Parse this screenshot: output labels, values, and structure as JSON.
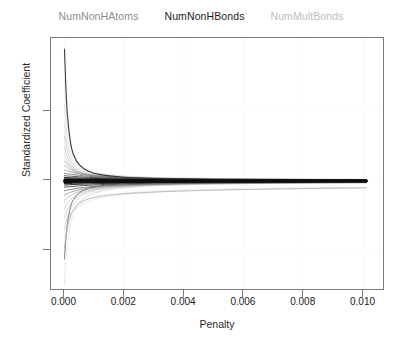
{
  "legend": {
    "position": "top-center",
    "items": [
      {
        "label": "NumNonHAtoms",
        "color": "#8c8c8c"
      },
      {
        "label": "NumNonHBonds",
        "color": "#1a1a1a"
      },
      {
        "label": "NumMultBonds",
        "color": "#bdbdbd"
      }
    ]
  },
  "axes": {
    "xlabel": "Penalty",
    "ylabel": "Standardized Coefficient",
    "xticks": [
      "0.000",
      "0.002",
      "0.004",
      "0.006",
      "0.008",
      "0.010"
    ],
    "yticks": [
      "10",
      "0",
      "-10"
    ]
  },
  "chart_data": {
    "type": "line",
    "title": "",
    "subtitle": "",
    "xlabel": "Penalty",
    "ylabel": "Standardized Coefficient",
    "xlim": [
      -0.00045,
      0.01065
    ],
    "ylim": [
      -15.5,
      20.5
    ],
    "xticks": [
      0.0,
      0.002,
      0.004,
      0.006,
      0.008,
      0.01
    ],
    "xtick_labels": [
      "0.000",
      "0.002",
      "0.004",
      "0.006",
      "0.008",
      "0.010"
    ],
    "yticks": [
      10,
      0,
      -10
    ],
    "ytick_labels": [
      "10",
      "0",
      "-10"
    ],
    "grid": true,
    "grid_color": "#fafafa",
    "legend_position": "top-center",
    "x": [
      0.0,
      5e-05,
      0.0001,
      0.0002,
      0.0003,
      0.0005,
      0.0008,
      0.0012,
      0.0018,
      0.0025,
      0.0035,
      0.005,
      0.0065,
      0.008,
      0.0095,
      0.0101
    ],
    "series": [
      {
        "name": "NumNonHBonds",
        "color": "#303030",
        "width": 1.1,
        "opacity": 0.95,
        "values": [
          18.9,
          13.2,
          9.4,
          5.6,
          3.8,
          2.3,
          1.4,
          0.9,
          0.6,
          0.42,
          0.3,
          0.2,
          0.15,
          0.1,
          0.08,
          0.07
        ]
      },
      {
        "name": "NumNonHAtoms",
        "color": "#6f6f6f",
        "width": 1.0,
        "opacity": 0.85,
        "values": [
          -11.2,
          -8.1,
          -6.0,
          -3.8,
          -2.7,
          -1.7,
          -1.05,
          -0.7,
          -0.46,
          -0.33,
          -0.24,
          -0.16,
          -0.12,
          -0.09,
          -0.07,
          -0.06
        ]
      },
      {
        "name": "NumMultBonds",
        "color": "#b0b0b0",
        "width": 1.0,
        "opacity": 0.8,
        "values": [
          -9.6,
          -7.9,
          -6.6,
          -5.0,
          -4.1,
          -3.2,
          -2.6,
          -2.2,
          -1.9,
          -1.7,
          -1.5,
          -1.32,
          -1.2,
          -1.1,
          -1.02,
          -1.0
        ]
      },
      {
        "name": "path-04",
        "color": "#9a9a9a",
        "width": 0.8,
        "opacity": 0.55,
        "values": [
          6.5,
          5.2,
          4.2,
          3.0,
          2.3,
          1.6,
          1.1,
          0.8,
          0.6,
          0.48,
          0.38,
          0.3,
          0.25,
          0.22,
          0.2,
          0.19
        ]
      },
      {
        "name": "path-05",
        "color": "#9a9a9a",
        "width": 0.8,
        "opacity": 0.55,
        "values": [
          4.8,
          4.0,
          3.3,
          2.4,
          1.9,
          1.35,
          0.95,
          0.72,
          0.55,
          0.45,
          0.36,
          0.29,
          0.25,
          0.22,
          0.2,
          0.19
        ]
      },
      {
        "name": "path-06",
        "color": "#a5a5a5",
        "width": 0.8,
        "opacity": 0.5,
        "values": [
          3.6,
          3.1,
          2.7,
          2.1,
          1.7,
          1.25,
          0.9,
          0.68,
          0.52,
          0.42,
          0.34,
          0.27,
          0.23,
          0.2,
          0.18,
          0.18
        ]
      },
      {
        "name": "path-07",
        "color": "#8a8a8a",
        "width": 0.9,
        "opacity": 0.6,
        "values": [
          2.9,
          2.6,
          2.3,
          1.85,
          1.55,
          1.2,
          0.9,
          0.7,
          0.55,
          0.45,
          0.36,
          0.29,
          0.24,
          0.21,
          0.19,
          0.18
        ]
      },
      {
        "name": "path-08",
        "color": "#8a8a8a",
        "width": 0.9,
        "opacity": 0.6,
        "values": [
          2.2,
          2.05,
          1.9,
          1.62,
          1.4,
          1.12,
          0.86,
          0.67,
          0.53,
          0.44,
          0.35,
          0.28,
          0.24,
          0.21,
          0.19,
          0.18
        ]
      },
      {
        "name": "path-09",
        "color": "#707070",
        "width": 0.9,
        "opacity": 0.7,
        "values": [
          1.6,
          1.52,
          1.44,
          1.3,
          1.18,
          1.0,
          0.8,
          0.64,
          0.51,
          0.42,
          0.34,
          0.27,
          0.23,
          0.2,
          0.18,
          0.17
        ]
      },
      {
        "name": "path-10",
        "color": "#5a5a5a",
        "width": 1.0,
        "opacity": 0.75,
        "values": [
          1.1,
          1.06,
          1.02,
          0.96,
          0.9,
          0.8,
          0.67,
          0.55,
          0.45,
          0.38,
          0.31,
          0.25,
          0.21,
          0.19,
          0.17,
          0.16
        ]
      },
      {
        "name": "path-11",
        "color": "#3a3a3a",
        "width": 1.0,
        "opacity": 0.85,
        "values": [
          0.75,
          0.73,
          0.71,
          0.68,
          0.65,
          0.59,
          0.52,
          0.44,
          0.37,
          0.31,
          0.26,
          0.21,
          0.18,
          0.16,
          0.15,
          0.14
        ]
      },
      {
        "name": "path-12",
        "color": "#262626",
        "width": 1.1,
        "opacity": 0.9,
        "values": [
          0.5,
          0.49,
          0.48,
          0.46,
          0.45,
          0.42,
          0.38,
          0.33,
          0.28,
          0.24,
          0.2,
          0.17,
          0.15,
          0.13,
          0.12,
          0.12
        ]
      },
      {
        "name": "path-13",
        "color": "#1a1a1a",
        "width": 1.4,
        "opacity": 0.95,
        "values": [
          0.3,
          0.3,
          0.29,
          0.29,
          0.28,
          0.27,
          0.25,
          0.22,
          0.19,
          0.17,
          0.14,
          0.12,
          0.1,
          0.09,
          0.09,
          0.08
        ]
      },
      {
        "name": "path-14",
        "color": "#0d0d0d",
        "width": 2.2,
        "opacity": 1.0,
        "values": [
          0.12,
          0.12,
          0.12,
          0.11,
          0.11,
          0.11,
          0.1,
          0.09,
          0.08,
          0.07,
          0.06,
          0.05,
          0.05,
          0.04,
          0.04,
          0.04
        ]
      },
      {
        "name": "path-15",
        "color": "#0d0d0d",
        "width": 2.4,
        "opacity": 1.0,
        "values": [
          0.0,
          0.0,
          0.0,
          0.0,
          0.0,
          0.0,
          0.0,
          0.0,
          0.0,
          0.0,
          0.0,
          0.0,
          0.0,
          0.0,
          0.0,
          0.0
        ]
      },
      {
        "name": "path-16",
        "color": "#0d0d0d",
        "width": 2.2,
        "opacity": 1.0,
        "values": [
          -0.14,
          -0.14,
          -0.13,
          -0.13,
          -0.12,
          -0.12,
          -0.11,
          -0.1,
          -0.09,
          -0.08,
          -0.07,
          -0.06,
          -0.05,
          -0.05,
          -0.04,
          -0.04
        ]
      },
      {
        "name": "path-17",
        "color": "#1a1a1a",
        "width": 1.5,
        "opacity": 0.95,
        "values": [
          -0.34,
          -0.33,
          -0.33,
          -0.32,
          -0.31,
          -0.3,
          -0.27,
          -0.24,
          -0.21,
          -0.18,
          -0.15,
          -0.12,
          -0.11,
          -0.1,
          -0.09,
          -0.09
        ]
      },
      {
        "name": "path-18",
        "color": "#262626",
        "width": 1.1,
        "opacity": 0.9,
        "values": [
          -0.58,
          -0.57,
          -0.56,
          -0.54,
          -0.52,
          -0.48,
          -0.43,
          -0.37,
          -0.31,
          -0.27,
          -0.22,
          -0.18,
          -0.16,
          -0.14,
          -0.13,
          -0.13
        ]
      },
      {
        "name": "path-19",
        "color": "#3a3a3a",
        "width": 1.0,
        "opacity": 0.85,
        "values": [
          -0.9,
          -0.88,
          -0.85,
          -0.82,
          -0.78,
          -0.71,
          -0.62,
          -0.53,
          -0.44,
          -0.37,
          -0.3,
          -0.25,
          -0.21,
          -0.19,
          -0.17,
          -0.17
        ]
      },
      {
        "name": "path-20",
        "color": "#5a5a5a",
        "width": 1.0,
        "opacity": 0.75,
        "values": [
          -1.4,
          -1.35,
          -1.3,
          -1.22,
          -1.15,
          -1.02,
          -0.86,
          -0.71,
          -0.58,
          -0.48,
          -0.39,
          -0.31,
          -0.26,
          -0.23,
          -0.21,
          -0.2
        ]
      },
      {
        "name": "path-21",
        "color": "#707070",
        "width": 0.9,
        "opacity": 0.7,
        "values": [
          -2.0,
          -1.9,
          -1.8,
          -1.64,
          -1.5,
          -1.28,
          -1.04,
          -0.83,
          -0.66,
          -0.54,
          -0.43,
          -0.34,
          -0.29,
          -0.25,
          -0.22,
          -0.22
        ]
      },
      {
        "name": "path-22",
        "color": "#8a8a8a",
        "width": 0.9,
        "opacity": 0.6,
        "values": [
          -2.8,
          -2.6,
          -2.4,
          -2.1,
          -1.86,
          -1.53,
          -1.2,
          -0.94,
          -0.73,
          -0.59,
          -0.47,
          -0.37,
          -0.31,
          -0.27,
          -0.24,
          -0.23
        ]
      },
      {
        "name": "path-23",
        "color": "#9a9a9a",
        "width": 0.85,
        "opacity": 0.55,
        "values": [
          -4.0,
          -3.6,
          -3.2,
          -2.7,
          -2.3,
          -1.82,
          -1.38,
          -1.05,
          -0.8,
          -0.64,
          -0.5,
          -0.39,
          -0.32,
          -0.28,
          -0.25,
          -0.24
        ]
      },
      {
        "name": "path-24",
        "color": "#a8a8a8",
        "width": 0.85,
        "opacity": 0.5,
        "values": [
          -5.4,
          -4.7,
          -4.1,
          -3.3,
          -2.8,
          -2.1,
          -1.55,
          -1.15,
          -0.87,
          -0.69,
          -0.53,
          -0.41,
          -0.34,
          -0.29,
          -0.26,
          -0.25
        ]
      },
      {
        "name": "path-25",
        "color": "#b4b4b4",
        "width": 0.85,
        "opacity": 0.45,
        "values": [
          -7.0,
          -6.0,
          -5.1,
          -4.0,
          -3.3,
          -2.4,
          -1.72,
          -1.26,
          -0.94,
          -0.73,
          -0.56,
          -0.43,
          -0.35,
          -0.3,
          -0.27,
          -0.26
        ]
      },
      {
        "name": "path-26",
        "color": "#c0c0c0",
        "width": 0.85,
        "opacity": 0.45,
        "values": [
          -10.4,
          -8.6,
          -7.2,
          -5.4,
          -4.3,
          -3.0,
          -2.05,
          -1.45,
          -1.05,
          -0.8,
          -0.6,
          -0.46,
          -0.37,
          -0.32,
          -0.28,
          -0.27
        ]
      },
      {
        "name": "path-27",
        "color": "#c8c8c8",
        "width": 0.85,
        "opacity": 0.4,
        "values": [
          -14.8,
          -11.4,
          -9.0,
          -6.4,
          -4.9,
          -3.3,
          -2.2,
          -1.53,
          -1.1,
          -0.83,
          -0.62,
          -0.47,
          -0.38,
          -0.33,
          -0.29,
          -0.28
        ]
      },
      {
        "name": "path-28",
        "color": "#c4c4c4",
        "width": 0.85,
        "opacity": 0.45,
        "values": [
          -6.2,
          -5.8,
          -5.4,
          -4.8,
          -4.3,
          -3.6,
          -2.95,
          -2.45,
          -2.05,
          -1.78,
          -1.52,
          -1.3,
          -1.17,
          -1.08,
          -1.02,
          -1.0
        ]
      },
      {
        "name": "path-29",
        "color": "#cccccc",
        "width": 0.8,
        "opacity": 0.4,
        "values": [
          -4.5,
          -4.3,
          -4.1,
          -3.75,
          -3.45,
          -3.0,
          -2.55,
          -2.15,
          -1.82,
          -1.58,
          -1.36,
          -1.16,
          -1.05,
          -0.97,
          -0.92,
          -0.9
        ]
      },
      {
        "name": "path-30",
        "color": "#b8b8b8",
        "width": 0.8,
        "opacity": 0.45,
        "values": [
          8.2,
          6.4,
          5.1,
          3.6,
          2.8,
          1.95,
          1.32,
          0.95,
          0.7,
          0.56,
          0.44,
          0.34,
          0.29,
          0.25,
          0.23,
          0.22
        ]
      },
      {
        "name": "path-31",
        "color": "#c0c0c0",
        "width": 0.8,
        "opacity": 0.4,
        "values": [
          11.0,
          8.3,
          6.4,
          4.3,
          3.2,
          2.15,
          1.4,
          1.0,
          0.73,
          0.58,
          0.45,
          0.35,
          0.29,
          0.26,
          0.23,
          0.22
        ]
      },
      {
        "name": "path-32",
        "color": "#cacaca",
        "width": 0.8,
        "opacity": 0.38,
        "values": [
          14.5,
          10.4,
          7.8,
          5.0,
          3.7,
          2.4,
          1.52,
          1.06,
          0.77,
          0.6,
          0.46,
          0.36,
          0.3,
          0.26,
          0.24,
          0.23
        ]
      }
    ]
  }
}
